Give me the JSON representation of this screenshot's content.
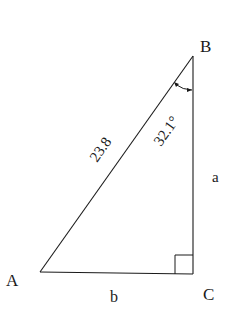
{
  "diagram": {
    "type": "right-triangle",
    "vertices": {
      "A": {
        "label": "A"
      },
      "B": {
        "label": "B"
      },
      "C": {
        "label": "C"
      }
    },
    "sides": {
      "hypotenuse": {
        "label": "23.8"
      },
      "vertical": {
        "label": "a"
      },
      "horizontal": {
        "label": "b"
      }
    },
    "angle_B": {
      "label": "32.1°"
    },
    "right_angle_at": "C",
    "colors": {
      "stroke": "#1a1a1a",
      "background": "#ffffff"
    }
  }
}
